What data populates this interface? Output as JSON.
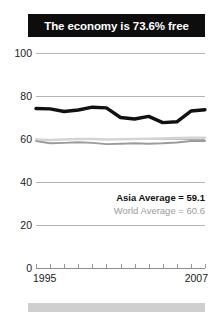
{
  "title": "The economy is 73.6% free",
  "footer": {
    "present": true
  },
  "legend": {
    "asia": "Asia Average = 59.1",
    "world": "World Average = 60.6"
  },
  "axis": {
    "y_ticks": [
      "100",
      "80",
      "60",
      "40",
      "20",
      "0"
    ],
    "x_start": "1995",
    "x_end": "2007"
  },
  "colors": {
    "banner_bg": "#0d0d0d",
    "banner_text": "#ffffff",
    "economy_line": "#111111",
    "asia_line": "#9b9b9b",
    "world_line": "#d4d4d4",
    "gridline": "#b3b3b3",
    "footer_bar": "#cfcfcf"
  },
  "chart_data": {
    "type": "line",
    "title": "The economy is 73.6% free",
    "xlabel": "",
    "ylabel": "",
    "ylim": [
      0,
      100
    ],
    "xlim": [
      1995,
      2007
    ],
    "grid": true,
    "legend_position": "inside-right",
    "x": [
      1995,
      1996,
      1997,
      1998,
      1999,
      2000,
      2001,
      2002,
      2003,
      2004,
      2005,
      2006,
      2007
    ],
    "series": [
      {
        "name": "Economy",
        "color": "#111111",
        "values": [
          74.2,
          74.0,
          72.8,
          73.5,
          74.8,
          74.5,
          70.0,
          69.3,
          70.5,
          67.6,
          68.0,
          73.0,
          73.6
        ]
      },
      {
        "name": "Asia Average",
        "color": "#9b9b9b",
        "value_label": "59.1",
        "values": [
          59.0,
          58.0,
          58.2,
          58.5,
          58.2,
          57.6,
          57.8,
          58.0,
          57.8,
          58.0,
          58.4,
          59.1,
          59.1
        ]
      },
      {
        "name": "World Average",
        "color": "#d4d4d4",
        "value_label": "60.6",
        "values": [
          59.8,
          59.5,
          59.8,
          60.0,
          60.0,
          59.8,
          59.9,
          60.0,
          60.1,
          60.2,
          60.4,
          60.6,
          60.6
        ]
      }
    ]
  }
}
